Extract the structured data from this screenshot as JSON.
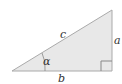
{
  "diagram": {
    "type": "right-triangle",
    "fill_color": "#e8e8e8",
    "stroke_color": "#aaaaaa",
    "labels": {
      "hypotenuse": "c",
      "opposite": "a",
      "adjacent": "b",
      "angle": "α"
    },
    "right_angle_marker": true
  }
}
